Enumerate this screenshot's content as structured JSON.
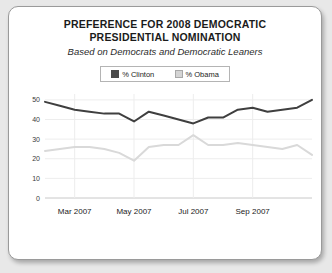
{
  "card": {
    "title_line_1": "PREFERENCE FOR 2008 DEMOCRATIC",
    "title_line_2": "PRESIDENTIAL NOMINATION",
    "subtitle": "Based on Democrats and Democratic Leaners"
  },
  "legend": {
    "entries": [
      {
        "label": "% Clinton",
        "swatch": "clinton-swatch",
        "color": "#4a4a4a"
      },
      {
        "label": "% Obama",
        "swatch": "obama-swatch",
        "color": "#d4d4d4"
      }
    ]
  },
  "chart_data": {
    "type": "line",
    "title": "PREFERENCE FOR 2008 DEMOCRATIC PRESIDENTIAL NOMINATION",
    "subtitle": "Based on Democrats and Democratic Leaners",
    "xlabel": "",
    "ylabel": "",
    "ylim": [
      0,
      53
    ],
    "yticks": [
      0,
      10,
      20,
      30,
      40,
      50
    ],
    "ytick_labels": [
      "0",
      "10",
      "20",
      "30",
      "40",
      "50"
    ],
    "xtick_labels": [
      "Mar 2007",
      "May 2007",
      "Jul 2007",
      "Sep 2007"
    ],
    "xtick_positions": [
      2,
      6,
      10,
      14
    ],
    "grid": true,
    "legend_position": "top-center",
    "x": [
      0,
      1,
      2,
      3,
      4,
      5,
      6,
      7,
      8,
      9,
      10,
      11,
      12,
      13,
      14,
      15,
      16,
      17,
      18
    ],
    "series": [
      {
        "name": "% Clinton",
        "color": "#3f3f3f",
        "values": [
          49,
          47,
          45,
          44,
          43,
          43,
          39,
          44,
          42,
          40,
          38,
          41,
          41,
          45,
          46,
          44,
          45,
          46,
          50
        ]
      },
      {
        "name": "% Obama",
        "color": "#d9d9d9",
        "values": [
          24,
          25,
          26,
          26,
          25,
          23,
          19,
          26,
          27,
          27,
          32,
          27,
          27,
          28,
          27,
          26,
          25,
          27,
          22
        ]
      }
    ]
  }
}
